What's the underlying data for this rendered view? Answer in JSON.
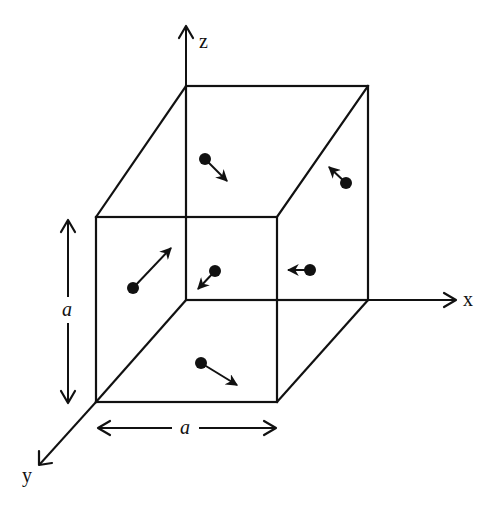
{
  "diagram": {
    "axes": {
      "x_label": "x",
      "y_label": "y",
      "z_label": "z"
    },
    "dimensions": {
      "height_label": "a",
      "width_label": "a"
    },
    "cube": {
      "front_face": {
        "left": 96,
        "right": 277,
        "top": 217,
        "bottom": 402
      },
      "back_face": {
        "left": 186,
        "right": 368,
        "top": 86,
        "bottom": 300
      }
    },
    "particles": [
      {
        "name": "particle-top-left",
        "x": 205,
        "y": 159,
        "dx": 22,
        "dy": 22
      },
      {
        "name": "particle-top-right",
        "x": 346,
        "y": 183,
        "dx": -18,
        "dy": -16
      },
      {
        "name": "particle-front-left",
        "x": 133,
        "y": 288,
        "dx": 38,
        "dy": -40
      },
      {
        "name": "particle-center",
        "x": 215,
        "y": 271,
        "dx": -18,
        "dy": 18
      },
      {
        "name": "particle-right",
        "x": 310,
        "y": 270,
        "dx": -22,
        "dy": 0
      },
      {
        "name": "particle-bottom",
        "x": 201,
        "y": 363,
        "dx": 36,
        "dy": 22
      }
    ]
  }
}
